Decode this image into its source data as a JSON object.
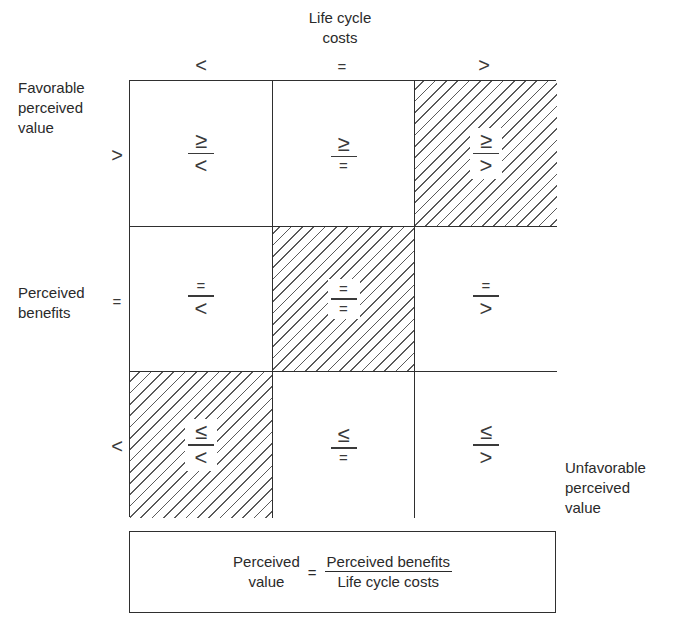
{
  "diagram": {
    "column_axis": {
      "title_line1": "Life cycle",
      "title_line2": "costs",
      "symbols": [
        "<",
        "=",
        ">"
      ]
    },
    "row_axis": {
      "top_label": [
        "Favorable",
        "perceived",
        "value"
      ],
      "middle_label": [
        "Perceived",
        "benefits"
      ],
      "symbols": [
        ">",
        "=",
        "<"
      ]
    },
    "bottom_right_label": [
      "Unfavorable",
      "perceived",
      "value"
    ],
    "cells": [
      [
        {
          "numerator": "≥",
          "denominator": "<",
          "hatched": false
        },
        {
          "numerator": "≥",
          "denominator": "=",
          "hatched": false
        },
        {
          "numerator": "≥",
          "denominator": ">",
          "hatched": true
        }
      ],
      [
        {
          "numerator": "=",
          "denominator": "<",
          "hatched": false
        },
        {
          "numerator": "=",
          "denominator": "=",
          "hatched": true
        },
        {
          "numerator": "=",
          "denominator": ">",
          "hatched": false
        }
      ],
      [
        {
          "numerator": "≤",
          "denominator": "<",
          "hatched": true
        },
        {
          "numerator": "≤",
          "denominator": "=",
          "hatched": false
        },
        {
          "numerator": "≤",
          "denominator": ">",
          "hatched": false
        }
      ]
    ],
    "formula": {
      "lhs_line1": "Perceived",
      "lhs_line2": "value",
      "equals": "=",
      "numerator": "Perceived benefits",
      "denominator": "Life cycle costs"
    },
    "colors": {
      "line": "#2f2f2f",
      "hatch": "#5a5a5a",
      "background": "#ffffff"
    }
  }
}
